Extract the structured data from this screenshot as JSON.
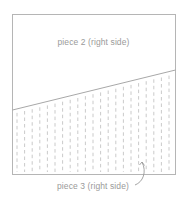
{
  "diagram": {
    "pieces": [
      {
        "id": "piece-2",
        "label": "piece 2 (right side)"
      },
      {
        "id": "piece-3",
        "label": "piece 3 (right side)"
      }
    ],
    "colors": {
      "outline": "#b5b5b5",
      "dash": "#bdbdbd",
      "text": "#9a9a9a",
      "background": "#ffffff"
    }
  }
}
